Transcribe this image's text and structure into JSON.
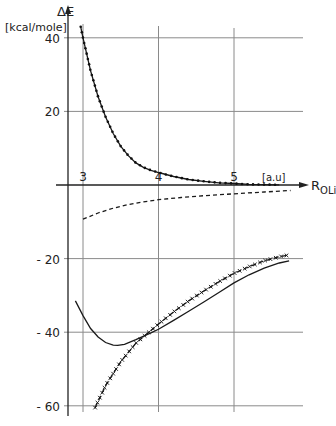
{
  "chart_data": {
    "type": "line",
    "title": "",
    "ylabel": "ΔE",
    "ylabel_unit": "[kcal/mole]",
    "xlabel": "R_OLi",
    "xlabel_main": "R",
    "xlabel_sub": "OLi",
    "xlabel_unit": "[a.u]",
    "xlim": [
      2.8,
      5.9
    ],
    "ylim": [
      -62,
      45
    ],
    "x_ticks": [
      3,
      4,
      5
    ],
    "x_tick_labels": [
      "3",
      "4",
      "5"
    ],
    "y_ticks": [
      40,
      20,
      -20,
      -40,
      -60
    ],
    "y_tick_labels": [
      "40",
      "20",
      "- 20",
      "- 40",
      "- 60"
    ],
    "grid": true,
    "legend": null,
    "series": [
      {
        "name": "repulsive (dotted)",
        "style": "solid-dotted",
        "x": [
          2.97,
          3.0,
          3.1,
          3.2,
          3.3,
          3.4,
          3.5,
          3.6,
          3.7,
          3.8,
          3.9,
          4.0,
          4.2,
          4.4,
          4.6,
          4.8,
          5.0,
          5.2,
          5.4,
          5.6
        ],
        "y": [
          43,
          40,
          31,
          24,
          18.5,
          14,
          10.5,
          8,
          6,
          4.8,
          4.0,
          3.4,
          2.3,
          1.5,
          1.0,
          0.6,
          0.4,
          0.2,
          0.1,
          0.05
        ]
      },
      {
        "name": "dashed",
        "style": "dashed",
        "x": [
          3.0,
          3.2,
          3.4,
          3.6,
          3.8,
          4.0,
          4.3,
          4.6,
          5.0,
          5.4,
          5.75
        ],
        "y": [
          -9.3,
          -7.6,
          -6.3,
          -5.3,
          -4.6,
          -4.0,
          -3.4,
          -2.9,
          -2.4,
          -1.9,
          -1.5
        ]
      },
      {
        "name": "total (solid)",
        "style": "solid",
        "x": [
          2.9,
          3.0,
          3.1,
          3.2,
          3.3,
          3.4,
          3.46,
          3.55,
          3.7,
          3.9,
          4.0,
          4.2,
          4.4,
          4.6,
          4.8,
          5.0,
          5.2,
          5.4,
          5.6,
          5.73
        ],
        "y": [
          -31.5,
          -35.5,
          -39,
          -41.3,
          -42.8,
          -43.5,
          -43.6,
          -43.3,
          -42,
          -40.2,
          -39.2,
          -36.8,
          -34.3,
          -31.8,
          -29.2,
          -26.6,
          -24.4,
          -22.6,
          -21.2,
          -20.6
        ]
      },
      {
        "name": "crossed (x markers)",
        "style": "dash-cross",
        "x": [
          3.16,
          3.3,
          3.5,
          3.7,
          3.9,
          4.0,
          4.2,
          4.4,
          4.6,
          4.8,
          5.0,
          5.2,
          5.4,
          5.6,
          5.73
        ],
        "y": [
          -60.5,
          -54.5,
          -48,
          -43,
          -39.5,
          -37.8,
          -34.5,
          -31.5,
          -28.8,
          -26.3,
          -24.0,
          -22.2,
          -20.6,
          -19.5,
          -19.0
        ]
      }
    ]
  }
}
